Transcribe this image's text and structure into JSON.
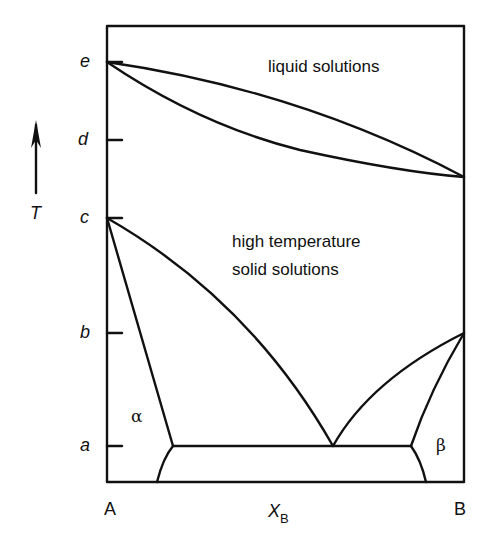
{
  "diagram": {
    "type": "binary phase diagram",
    "axis": {
      "temperature_label": "T",
      "composition_label": "X",
      "composition_subscript": "B",
      "left_component": "A",
      "right_component": "B",
      "temperature_ticks": [
        "e",
        "d",
        "c",
        "b",
        "a"
      ]
    },
    "regions": {
      "liquid": "liquid solutions",
      "high_temp_solid_line1": "high temperature",
      "high_temp_solid_line2": "solid solutions",
      "alpha": "α",
      "beta": "β"
    }
  }
}
